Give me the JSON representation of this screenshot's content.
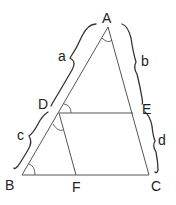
{
  "diagram": {
    "title": "",
    "points": [
      {
        "id": "A",
        "label": "A"
      },
      {
        "id": "B",
        "label": "B"
      },
      {
        "id": "C",
        "label": "C"
      },
      {
        "id": "D",
        "label": "D"
      },
      {
        "id": "E",
        "label": "E"
      },
      {
        "id": "F",
        "label": "F"
      }
    ],
    "segments": [
      {
        "from": "A",
        "to": "B"
      },
      {
        "from": "A",
        "to": "C"
      },
      {
        "from": "B",
        "to": "C"
      },
      {
        "from": "D",
        "to": "E"
      },
      {
        "from": "D",
        "to": "F"
      }
    ],
    "braces": [
      {
        "label": "a",
        "spans": [
          "A",
          "D"
        ]
      },
      {
        "label": "c",
        "spans": [
          "D",
          "B"
        ]
      },
      {
        "label": "b",
        "spans": [
          "A",
          "E"
        ]
      },
      {
        "label": "d",
        "spans": [
          "E",
          "C"
        ]
      }
    ],
    "angle_marks": [
      "A",
      "D-upper",
      "D-lower",
      "B"
    ],
    "colors": {
      "line": "#555555",
      "brace": "#333333",
      "text": "#222222",
      "background": "#ffffff"
    }
  }
}
